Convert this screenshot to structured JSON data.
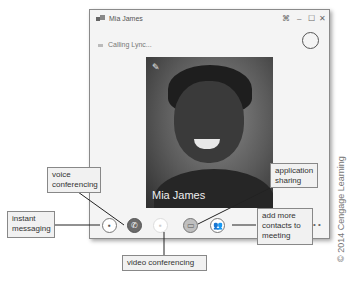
{
  "window": {
    "title": "Mia James",
    "controls": {
      "pin": "⌘",
      "minimize": "–",
      "maximize": "☐",
      "close": "✕"
    },
    "status": "Calling Lync...",
    "video_name": "Mia James"
  },
  "toolbar": {
    "buttons": [
      {
        "name": "instant-messaging",
        "glyph": "▪"
      },
      {
        "name": "voice",
        "glyph": "✆"
      },
      {
        "name": "video",
        "glyph": "▪"
      },
      {
        "name": "app-sharing",
        "glyph": "▭"
      },
      {
        "name": "add-contacts",
        "glyph": "👥"
      }
    ],
    "more": "• •"
  },
  "callouts": {
    "voice": "voice conferencing",
    "im": "instant messaging",
    "app": "application sharing",
    "add": "add more contacts to meeting",
    "video": "video conferencing"
  },
  "copyright": "© 2014 Cengage Learning"
}
